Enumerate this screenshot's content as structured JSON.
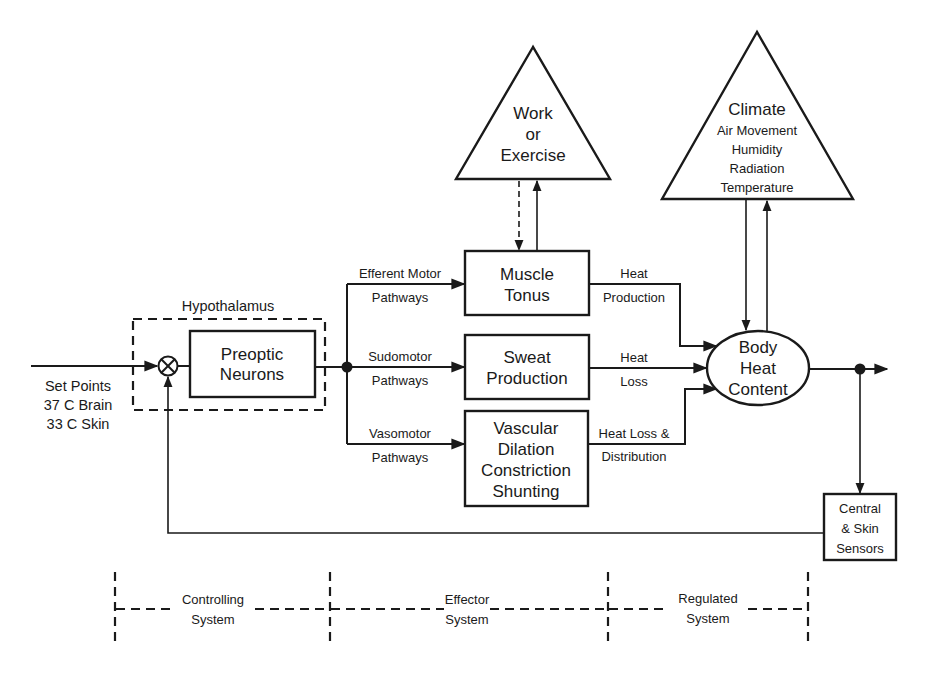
{
  "diagram": {
    "input": {
      "label_lines": [
        "Set Points",
        "37  C Brain",
        "33  C Skin"
      ]
    },
    "hypothalamus": {
      "label": "Hypothalamus",
      "preoptic": [
        "Preoptic",
        "Neurons"
      ]
    },
    "pathways": {
      "efferent": [
        "Efferent Motor",
        "Pathways"
      ],
      "sudomotor": [
        "Sudomotor",
        "Pathways"
      ],
      "vasomotor": [
        "Vasomotor",
        "Pathways"
      ]
    },
    "effectors": {
      "muscle": [
        "Muscle",
        "Tonus"
      ],
      "sweat": [
        "Sweat",
        "Production"
      ],
      "vascular": [
        "Vascular",
        "Dilation",
        "Constriction",
        "Shunting"
      ]
    },
    "outputs": {
      "heat_production": [
        "Heat",
        "Production"
      ],
      "heat_loss": [
        "Heat",
        "Loss"
      ],
      "distribution": [
        "Heat Loss &",
        "Distribution"
      ]
    },
    "disturbances": {
      "work": [
        "Work",
        "or",
        "Exercise"
      ],
      "climate": [
        "Climate",
        "Air Movement",
        "Humidity",
        "Radiation",
        "Temperature"
      ]
    },
    "body": [
      "Body",
      "Heat",
      "Content"
    ],
    "sensors": [
      "Central",
      "& Skin",
      "Sensors"
    ],
    "systems": {
      "controlling": [
        "Controlling",
        "System"
      ],
      "effector": [
        "Effector",
        "System"
      ],
      "regulated": [
        "Regulated",
        "System"
      ]
    },
    "colors": {
      "stroke": "#1a1a1a",
      "background": "#ffffff"
    }
  }
}
